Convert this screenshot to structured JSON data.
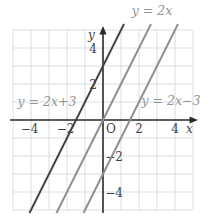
{
  "chart_data": {
    "type": "line",
    "title": "",
    "xlabel": "x",
    "ylabel": "y",
    "origin_label": "O",
    "xlim": [
      -5,
      5
    ],
    "ylim": [
      -5,
      5
    ],
    "grid": true,
    "equations": [
      {
        "label": "y = 2x+3",
        "slope": 2,
        "intercept": 3,
        "color": "#424242",
        "name": "line-y-2x-plus-3"
      },
      {
        "label": "y = 2x",
        "slope": 2,
        "intercept": 0,
        "color": "#8f8f8f",
        "name": "line-y-2x"
      },
      {
        "label": "y = 2x−3",
        "slope": 2,
        "intercept": -3,
        "color": "#8f8f8f",
        "name": "line-y-2x-minus-3"
      }
    ],
    "x_ticks": [
      {
        "value": -4,
        "label": "−4"
      },
      {
        "value": -2,
        "label": "−2"
      },
      {
        "value": 2,
        "label": "2"
      },
      {
        "value": 4,
        "label": "4"
      }
    ],
    "y_ticks": [
      {
        "value": 4,
        "label": "4"
      },
      {
        "value": 2,
        "label": "2"
      },
      {
        "value": -2,
        "label": "−2"
      },
      {
        "value": -4,
        "label": "−4"
      }
    ],
    "colors": {
      "background": "#ffffff",
      "grid": "#d9dfe1",
      "axis": "#2b2b2b",
      "tick_text": "#3f3f3f",
      "label_text": "#949494"
    }
  }
}
